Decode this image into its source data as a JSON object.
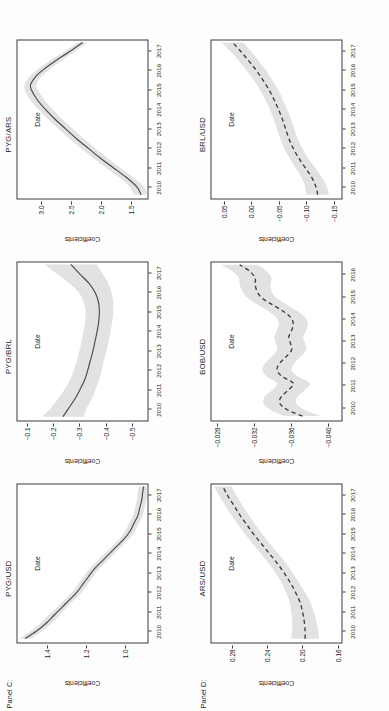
{
  "figure": {
    "rows": [
      {
        "label": "Panel C:",
        "line_style": "solid"
      },
      {
        "label": "Panel D:",
        "line_style": "dashed"
      }
    ]
  },
  "chart_data": [
    {
      "type": "line",
      "panel": "Panel C:",
      "title": "PYG/USD",
      "xlabel": "Date",
      "ylabel": "Coefficients",
      "xticks": [
        "2010",
        "2011",
        "2012",
        "2013",
        "2014",
        "2015",
        "2016",
        "2017"
      ],
      "yticks": [
        "1.4",
        "1.2",
        "1.0"
      ],
      "xlim": [
        2009.4,
        2017.6
      ],
      "ylim": [
        0.88,
        1.56
      ],
      "line_style": "solid",
      "grid": false,
      "legend": "none",
      "x": [
        2009.6,
        2010.0,
        2010.4,
        2010.8,
        2011.2,
        2011.6,
        2012.0,
        2012.4,
        2012.8,
        2013.2,
        2013.6,
        2014.0,
        2014.4,
        2014.8,
        2015.2,
        2015.6,
        2016.0,
        2016.4,
        2016.8,
        2017.2,
        2017.5
      ],
      "values": [
        1.52,
        1.46,
        1.41,
        1.37,
        1.33,
        1.29,
        1.25,
        1.22,
        1.19,
        1.16,
        1.12,
        1.08,
        1.04,
        1.0,
        0.97,
        0.95,
        0.93,
        0.92,
        0.91,
        0.905,
        0.9
      ],
      "ci_upper": [
        1.55,
        1.49,
        1.44,
        1.4,
        1.355,
        1.315,
        1.275,
        1.245,
        1.215,
        1.185,
        1.145,
        1.105,
        1.065,
        1.025,
        0.995,
        0.975,
        0.955,
        0.945,
        0.935,
        0.93,
        0.925
      ],
      "ci_lower": [
        1.49,
        1.43,
        1.38,
        1.34,
        1.305,
        1.265,
        1.225,
        1.195,
        1.165,
        1.135,
        1.095,
        1.055,
        1.015,
        0.975,
        0.945,
        0.925,
        0.905,
        0.895,
        0.885,
        0.88,
        0.875
      ]
    },
    {
      "type": "line",
      "panel": "Panel C:",
      "title": "PYG/BRL",
      "xlabel": "Date",
      "ylabel": "Coefficients",
      "xticks": [
        "2010",
        "2011",
        "2012",
        "2013",
        "2014",
        "2015",
        "2016",
        "2017"
      ],
      "yticks": [
        "-0.1",
        "-0.2",
        "-0.3",
        "-0.4",
        "-0.5"
      ],
      "xlim": [
        2009.4,
        2017.6
      ],
      "ylim": [
        -0.56,
        -0.06
      ],
      "line_style": "solid",
      "grid": false,
      "legend": "none",
      "x": [
        2009.6,
        2010.0,
        2010.5,
        2011.0,
        2011.5,
        2012.0,
        2012.5,
        2013.0,
        2013.5,
        2014.0,
        2014.5,
        2015.0,
        2015.5,
        2016.0,
        2016.5,
        2017.0,
        2017.5
      ],
      "values": [
        -0.235,
        -0.255,
        -0.28,
        -0.3,
        -0.318,
        -0.33,
        -0.34,
        -0.35,
        -0.358,
        -0.366,
        -0.372,
        -0.375,
        -0.372,
        -0.36,
        -0.336,
        -0.3,
        -0.265
      ],
      "ci_upper": [
        -0.155,
        -0.185,
        -0.215,
        -0.24,
        -0.262,
        -0.276,
        -0.288,
        -0.298,
        -0.306,
        -0.314,
        -0.32,
        -0.322,
        -0.316,
        -0.298,
        -0.262,
        -0.212,
        -0.165
      ],
      "ci_lower": [
        -0.315,
        -0.325,
        -0.345,
        -0.36,
        -0.374,
        -0.384,
        -0.392,
        -0.402,
        -0.41,
        -0.418,
        -0.424,
        -0.428,
        -0.428,
        -0.422,
        -0.41,
        -0.388,
        -0.365
      ]
    },
    {
      "type": "line",
      "panel": "Panel C:",
      "title": "PYG/ARS",
      "xlabel": "Date",
      "ylabel": "Coefficients",
      "xticks": [
        "2010",
        "2011",
        "2012",
        "2013",
        "2014",
        "2015",
        "2016",
        "2017"
      ],
      "yticks": [
        "3.0",
        "2.5",
        "2.0",
        "1.5"
      ],
      "xlim": [
        2009.4,
        2017.6
      ],
      "ylim": [
        1.22,
        3.42
      ],
      "line_style": "solid",
      "grid": false,
      "legend": "none",
      "x": [
        2009.6,
        2010.0,
        2010.5,
        2011.0,
        2011.5,
        2012.0,
        2012.5,
        2013.0,
        2013.5,
        2014.0,
        2014.5,
        2015.0,
        2015.3,
        2015.7,
        2016.0,
        2016.5,
        2017.0,
        2017.5
      ],
      "values": [
        1.33,
        1.4,
        1.58,
        1.8,
        2.02,
        2.22,
        2.42,
        2.6,
        2.78,
        2.94,
        3.08,
        3.18,
        3.2,
        3.12,
        3.02,
        2.8,
        2.55,
        2.32
      ],
      "ci_upper": [
        1.45,
        1.52,
        1.7,
        1.92,
        2.14,
        2.34,
        2.54,
        2.72,
        2.9,
        3.06,
        3.2,
        3.29,
        3.3,
        3.22,
        3.12,
        2.9,
        2.64,
        2.4
      ],
      "ci_lower": [
        1.21,
        1.28,
        1.46,
        1.68,
        1.9,
        2.1,
        2.3,
        2.48,
        2.66,
        2.82,
        2.96,
        3.07,
        3.1,
        3.02,
        2.92,
        2.7,
        2.46,
        2.24
      ]
    },
    {
      "type": "line",
      "panel": "Panel D:",
      "title": "ARS/USD",
      "xlabel": "Date",
      "ylabel": "Coefficients",
      "xticks": [
        "2010",
        "2011",
        "2012",
        "2013",
        "2014",
        "2015",
        "2016",
        "2017"
      ],
      "yticks": [
        "0.28",
        "0.24",
        "0.20",
        "0.16"
      ],
      "xlim": [
        2009.4,
        2017.6
      ],
      "ylim": [
        0.155,
        0.305
      ],
      "line_style": "dashed",
      "grid": false,
      "legend": "none",
      "x": [
        2009.6,
        2010.0,
        2010.5,
        2011.0,
        2011.5,
        2012.0,
        2012.5,
        2013.0,
        2013.5,
        2014.0,
        2014.5,
        2015.0,
        2015.5,
        2016.0,
        2016.5,
        2017.0,
        2017.5
      ],
      "values": [
        0.197,
        0.197,
        0.198,
        0.2,
        0.203,
        0.208,
        0.214,
        0.221,
        0.229,
        0.238,
        0.247,
        0.256,
        0.264,
        0.272,
        0.279,
        0.286,
        0.292
      ],
      "ci_upper": [
        0.213,
        0.212,
        0.212,
        0.213,
        0.215,
        0.219,
        0.224,
        0.231,
        0.239,
        0.248,
        0.257,
        0.266,
        0.274,
        0.282,
        0.289,
        0.296,
        0.302
      ],
      "ci_lower": [
        0.181,
        0.182,
        0.184,
        0.187,
        0.191,
        0.197,
        0.204,
        0.211,
        0.219,
        0.228,
        0.237,
        0.246,
        0.254,
        0.262,
        0.269,
        0.276,
        0.282
      ]
    },
    {
      "type": "line",
      "panel": "Panel D:",
      "title": "BOB/USD",
      "xlabel": "Date",
      "ylabel": "Coefficients",
      "xticks": [
        "2010",
        "2011",
        "2012",
        "2013",
        "2014",
        "2015",
        "2016"
      ],
      "yticks": [
        "-0.028",
        "-0.032",
        "-0.036",
        "-0.040"
      ],
      "xlim": [
        2009.4,
        2016.6
      ],
      "ylim": [
        -0.0415,
        -0.0272
      ],
      "line_style": "dashed",
      "grid": false,
      "legend": "none",
      "x": [
        2009.6,
        2009.9,
        2010.2,
        2010.5,
        2010.8,
        2011.1,
        2011.4,
        2011.7,
        2012.0,
        2012.3,
        2012.6,
        2012.9,
        2013.2,
        2013.5,
        2013.8,
        2014.1,
        2014.4,
        2014.7,
        2015.0,
        2015.3,
        2015.6,
        2015.9,
        2016.2,
        2016.5
      ],
      "values": [
        -0.0372,
        -0.0355,
        -0.0347,
        -0.0349,
        -0.0357,
        -0.0362,
        -0.035,
        -0.0344,
        -0.0347,
        -0.0354,
        -0.036,
        -0.0359,
        -0.0357,
        -0.036,
        -0.0362,
        -0.0359,
        -0.035,
        -0.0338,
        -0.0327,
        -0.0322,
        -0.032,
        -0.032,
        -0.0314,
        -0.0303
      ],
      "ci_upper": [
        -0.0352,
        -0.0336,
        -0.0329,
        -0.0331,
        -0.0339,
        -0.0344,
        -0.0333,
        -0.0328,
        -0.0331,
        -0.0338,
        -0.0344,
        -0.0343,
        -0.0341,
        -0.0344,
        -0.0346,
        -0.0343,
        -0.0334,
        -0.0322,
        -0.0311,
        -0.0306,
        -0.0303,
        -0.0302,
        -0.0295,
        -0.0283
      ],
      "ci_lower": [
        -0.0392,
        -0.0374,
        -0.0365,
        -0.0367,
        -0.0375,
        -0.038,
        -0.0367,
        -0.036,
        -0.0363,
        -0.037,
        -0.0376,
        -0.0375,
        -0.0373,
        -0.0376,
        -0.0378,
        -0.0375,
        -0.0366,
        -0.0354,
        -0.0343,
        -0.0338,
        -0.0337,
        -0.0338,
        -0.0333,
        -0.0323
      ]
    },
    {
      "type": "line",
      "panel": "Panel D:",
      "title": "BRL/USD",
      "xlabel": "Date",
      "ylabel": "Coefficients",
      "xticks": [
        "2010",
        "2011",
        "2012",
        "2013",
        "2014",
        "2015",
        "2016",
        "2017"
      ],
      "yticks": [
        "0.05",
        "0.00",
        "-0.05",
        "-0.10",
        "-0.15"
      ],
      "xlim": [
        2009.4,
        2017.6
      ],
      "ylim": [
        -0.165,
        0.075
      ],
      "line_style": "dashed",
      "grid": false,
      "legend": "none",
      "x": [
        2009.6,
        2010.0,
        2010.5,
        2011.0,
        2011.5,
        2012.0,
        2012.5,
        2013.0,
        2013.5,
        2014.0,
        2014.5,
        2015.0,
        2015.5,
        2016.0,
        2016.5,
        2017.0,
        2017.5
      ],
      "values": [
        -0.121,
        -0.118,
        -0.11,
        -0.098,
        -0.086,
        -0.076,
        -0.068,
        -0.062,
        -0.056,
        -0.049,
        -0.041,
        -0.032,
        -0.021,
        -0.009,
        0.005,
        0.02,
        0.036
      ],
      "ci_upper": [
        -0.1,
        -0.098,
        -0.091,
        -0.08,
        -0.069,
        -0.059,
        -0.052,
        -0.046,
        -0.04,
        -0.033,
        -0.025,
        -0.015,
        -0.004,
        0.009,
        0.023,
        0.039,
        0.056
      ],
      "ci_lower": [
        -0.142,
        -0.138,
        -0.129,
        -0.116,
        -0.103,
        -0.093,
        -0.084,
        -0.078,
        -0.072,
        -0.065,
        -0.057,
        -0.049,
        -0.038,
        -0.027,
        -0.013,
        0.001,
        0.016
      ]
    }
  ]
}
